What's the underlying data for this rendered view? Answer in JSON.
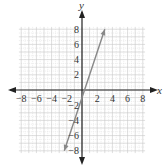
{
  "chart_data": {
    "type": "line",
    "title": "",
    "xlabel": "x",
    "ylabel": "y",
    "xlim": [
      -8,
      8
    ],
    "ylim": [
      -8,
      8
    ],
    "grid": true,
    "x_ticks": [
      -8,
      -6,
      -4,
      -2,
      2,
      4,
      6,
      8
    ],
    "y_ticks": [
      8,
      6,
      4,
      2,
      -2,
      -4,
      -6,
      -8
    ],
    "x_tick_labels": [
      "−8",
      "−6",
      "−4",
      "−2",
      "2",
      "4",
      "6",
      "8"
    ],
    "y_tick_labels": [
      "8",
      "6",
      "4",
      "2",
      "−2",
      "−4",
      "−6",
      "−8"
    ],
    "series": [
      {
        "name": "y = 3x − 1",
        "equation": "y = 3x - 1",
        "x": [
          -2.33,
          3
        ],
        "y": [
          -8,
          8
        ],
        "color": "#888888",
        "arrows": "both"
      }
    ],
    "colors": {
      "axis": "#222222",
      "grid_major": "#c8c8c8",
      "grid_minor": "#e2e2e2",
      "line": "#888888"
    }
  }
}
